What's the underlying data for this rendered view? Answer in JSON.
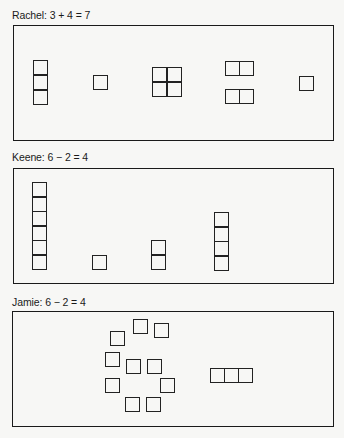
{
  "panels": [
    {
      "id": "p1",
      "label": "Rachel: 3 + 4 = 7",
      "groups": [
        {
          "name": "vertical-stack-3",
          "cells": [
            [
              33,
              60
            ],
            [
              33,
              75
            ],
            [
              33,
              90
            ]
          ]
        },
        {
          "name": "single-square",
          "cells": [
            [
              93,
              75
            ]
          ]
        },
        {
          "name": "square-2x2",
          "cells": [
            [
              152,
              67
            ],
            [
              167,
              67
            ],
            [
              152,
              82
            ],
            [
              167,
              82
            ]
          ]
        },
        {
          "name": "horizontal-pair-top",
          "cells": [
            [
              225,
              61
            ],
            [
              239,
              61
            ]
          ]
        },
        {
          "name": "horizontal-pair-bottom",
          "cells": [
            [
              225,
              89
            ],
            [
              239,
              89
            ]
          ]
        },
        {
          "name": "single-square",
          "cells": [
            [
              299,
              76
            ]
          ]
        }
      ]
    },
    {
      "id": "p2",
      "label": "Keene: 6 − 2 = 4",
      "groups": [
        {
          "name": "vertical-stack-6",
          "cells": [
            [
              32,
              182
            ],
            [
              32,
              196.5
            ],
            [
              32,
              211
            ],
            [
              32,
              225.5
            ],
            [
              32,
              240
            ],
            [
              32,
              254.5
            ]
          ]
        },
        {
          "name": "single-square",
          "cells": [
            [
              92,
              255
            ]
          ]
        },
        {
          "name": "vertical-stack-2",
          "cells": [
            [
              151,
              240
            ],
            [
              151,
              255
            ]
          ]
        },
        {
          "name": "vertical-stack-4",
          "cells": [
            [
              214,
              212
            ],
            [
              214,
              226.5
            ],
            [
              214,
              241
            ],
            [
              214,
              255.5
            ]
          ]
        }
      ]
    },
    {
      "id": "p3",
      "label": "Jamie: 6 − 2 = 4",
      "groups": [
        {
          "name": "scattered-squares-10",
          "cells": [
            [
              110,
              331
            ],
            [
              133,
              319
            ],
            [
              154,
              323
            ],
            [
              105,
              352
            ],
            [
              126,
              359
            ],
            [
              147,
              359
            ],
            [
              105,
              378
            ],
            [
              160,
              378
            ],
            [
              125,
              397
            ],
            [
              146,
              397
            ]
          ]
        },
        {
          "name": "horizontal-row-3",
          "cells": [
            [
              210,
              368
            ],
            [
              224,
              368
            ],
            [
              238,
              368
            ]
          ]
        }
      ]
    }
  ],
  "cell_size": 14.5,
  "colors": {
    "background": "#f7f7f5",
    "ink": "#1a1a1a"
  }
}
